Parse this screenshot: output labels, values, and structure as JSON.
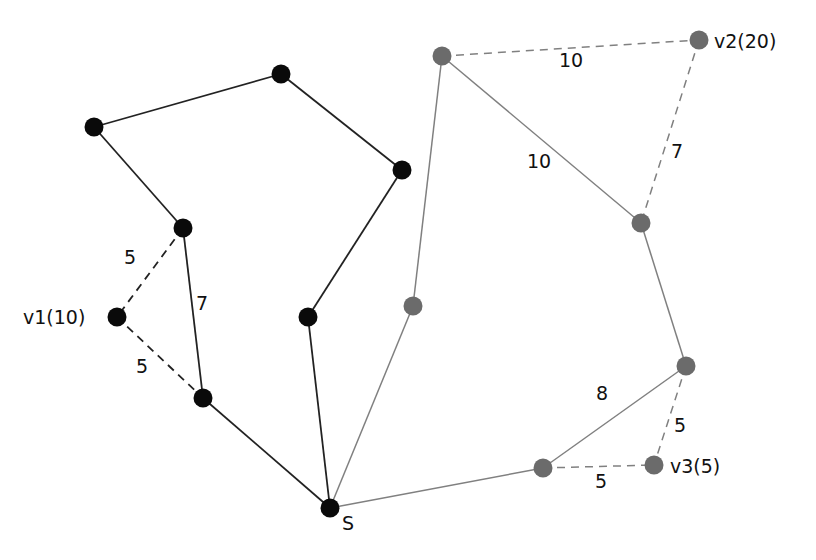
{
  "diagram": {
    "colors": {
      "black_node": "#0a0a0a",
      "gray_node": "#6b6b6b",
      "black_edge": "#222222",
      "gray_edge": "#808080",
      "text": "#111111"
    },
    "nodes": [
      {
        "id": "A",
        "x": 281,
        "y": 74,
        "group": "black",
        "label": ""
      },
      {
        "id": "B",
        "x": 94,
        "y": 127,
        "group": "black",
        "label": ""
      },
      {
        "id": "C",
        "x": 402,
        "y": 170,
        "group": "black",
        "label": ""
      },
      {
        "id": "D",
        "x": 183,
        "y": 228,
        "group": "black",
        "label": ""
      },
      {
        "id": "v1",
        "x": 117,
        "y": 317,
        "group": "black",
        "label": "v1(10)",
        "lx": 23,
        "ly": 324
      },
      {
        "id": "E",
        "x": 308,
        "y": 317,
        "group": "black",
        "label": ""
      },
      {
        "id": "F",
        "x": 203,
        "y": 398,
        "group": "black",
        "label": ""
      },
      {
        "id": "S",
        "x": 330,
        "y": 508,
        "group": "black",
        "label": "S",
        "lx": 342,
        "ly": 530
      },
      {
        "id": "G",
        "x": 442,
        "y": 56,
        "group": "gray",
        "label": ""
      },
      {
        "id": "v2",
        "x": 699,
        "y": 40,
        "group": "gray",
        "label": "v2(20)",
        "lx": 714,
        "ly": 48
      },
      {
        "id": "H",
        "x": 641,
        "y": 223,
        "group": "gray",
        "label": ""
      },
      {
        "id": "I",
        "x": 413,
        "y": 306,
        "group": "gray",
        "label": ""
      },
      {
        "id": "J",
        "x": 686,
        "y": 366,
        "group": "gray",
        "label": ""
      },
      {
        "id": "K",
        "x": 543,
        "y": 468,
        "group": "gray",
        "label": ""
      },
      {
        "id": "v3",
        "x": 654,
        "y": 465,
        "group": "gray",
        "label": "v3(5)",
        "lx": 670,
        "ly": 473
      }
    ],
    "edges": [
      {
        "from": "B",
        "to": "A",
        "style": "solid",
        "group": "black",
        "weight": ""
      },
      {
        "from": "A",
        "to": "C",
        "style": "solid",
        "group": "black",
        "weight": ""
      },
      {
        "from": "B",
        "to": "D",
        "style": "solid",
        "group": "black",
        "weight": ""
      },
      {
        "from": "C",
        "to": "E",
        "style": "solid",
        "group": "black",
        "weight": ""
      },
      {
        "from": "D",
        "to": "F",
        "style": "solid",
        "group": "black",
        "weight": "7",
        "wx": 196,
        "wy": 310
      },
      {
        "from": "D",
        "to": "v1",
        "style": "dashed",
        "group": "black",
        "weight": "5",
        "wx": 124,
        "wy": 264
      },
      {
        "from": "v1",
        "to": "F",
        "style": "dashed",
        "group": "black",
        "weight": "5",
        "wx": 136,
        "wy": 373
      },
      {
        "from": "F",
        "to": "S",
        "style": "solid",
        "group": "black",
        "weight": ""
      },
      {
        "from": "E",
        "to": "S",
        "style": "solid",
        "group": "black",
        "weight": ""
      },
      {
        "from": "S",
        "to": "I",
        "style": "solid",
        "group": "gray",
        "weight": ""
      },
      {
        "from": "I",
        "to": "G",
        "style": "solid",
        "group": "gray",
        "weight": ""
      },
      {
        "from": "G",
        "to": "H",
        "style": "solid",
        "group": "gray",
        "weight": "10",
        "wx": 527,
        "wy": 168
      },
      {
        "from": "G",
        "to": "v2",
        "style": "dashed",
        "group": "gray",
        "weight": "10",
        "wx": 559,
        "wy": 67
      },
      {
        "from": "v2",
        "to": "H",
        "style": "dashed",
        "group": "gray",
        "weight": "7",
        "wx": 671,
        "wy": 158
      },
      {
        "from": "H",
        "to": "J",
        "style": "solid",
        "group": "gray",
        "weight": ""
      },
      {
        "from": "J",
        "to": "K",
        "style": "solid",
        "group": "gray",
        "weight": "8",
        "wx": 596,
        "wy": 400
      },
      {
        "from": "S",
        "to": "K",
        "style": "solid",
        "group": "gray",
        "weight": ""
      },
      {
        "from": "K",
        "to": "v3",
        "style": "dashed",
        "group": "gray",
        "weight": "5",
        "wx": 595,
        "wy": 488
      },
      {
        "from": "J",
        "to": "v3",
        "style": "dashed",
        "group": "gray",
        "weight": "5",
        "wx": 674,
        "wy": 432
      }
    ]
  }
}
